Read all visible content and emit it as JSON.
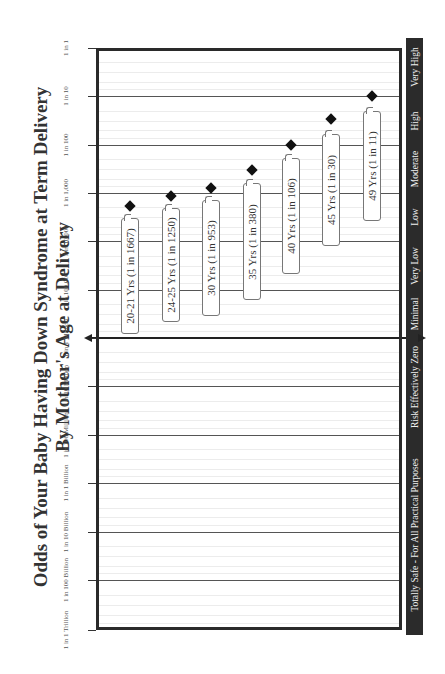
{
  "title": {
    "line1": "Odds of Your Baby Having Down Syndrome at Term Delivery",
    "line2": "By Mother's Age at Delivery"
  },
  "y_axis": {
    "ticks": [
      {
        "label": "1 in 1",
        "y": 48
      },
      {
        "label": "1 in 10",
        "y": 96
      },
      {
        "label": "1 in 100",
        "y": 145
      },
      {
        "label": "1 in 1,000",
        "y": 193
      },
      {
        "label": "1 in 10,000",
        "y": 241
      },
      {
        "label": "1 in 100,000",
        "y": 290
      },
      {
        "label": "1 in 1 Million",
        "y": 338
      },
      {
        "label": "1 in 10 Million",
        "y": 386
      },
      {
        "label": "1 in 100 Million",
        "y": 435
      },
      {
        "label": "1 in 1 Billion",
        "y": 483
      },
      {
        "label": "1 in 10 Billion",
        "y": 532
      },
      {
        "label": "1 in 100 Billion",
        "y": 580
      },
      {
        "label": "1 in 1 Trillion",
        "y": 630
      }
    ]
  },
  "risk_categories": [
    {
      "label": "Very High",
      "y0": 38,
      "y1": 96
    },
    {
      "label": "High",
      "y0": 96,
      "y1": 145
    },
    {
      "label": "Moderate",
      "y0": 145,
      "y1": 193
    },
    {
      "label": "Low",
      "y0": 193,
      "y1": 241
    },
    {
      "label": "Very Low",
      "y0": 241,
      "y1": 290
    },
    {
      "label": "Minimal",
      "y0": 290,
      "y1": 338
    },
    {
      "label": "Risk Effectively Zero",
      "y0": 338,
      "y1": 435
    },
    {
      "label": "Totally Safe - For All Practical Purposes",
      "y0": 435,
      "y1": 635
    }
  ],
  "chart_data": {
    "type": "scatter",
    "title": "Odds of Your Baby Having Down Syndrome at Term Delivery",
    "subtitle": "By Mother's Age at Delivery",
    "orientation": "rotated 90deg counter-clockwise",
    "xlabel": "Mother's Age at Delivery",
    "ylabel": "Odds (log scale)",
    "yscale": "log",
    "ylim": [
      "1 in 1 Trillion",
      "1 in 1"
    ],
    "grid": true,
    "categories": [
      "20-21 Yrs",
      "24-25 Yrs",
      "30 Yrs",
      "35 Yrs",
      "40 Yrs",
      "45 Yrs",
      "49 Yrs"
    ],
    "series": [
      {
        "name": "Odds (1 in N)",
        "values": [
          1667,
          1250,
          953,
          380,
          106,
          30,
          11
        ]
      }
    ],
    "labels": [
      "20-21 Yrs (1 in 1667)",
      "24-25 Yrs (1 in 1250)",
      "30 Yrs (1 in 953)",
      "35 Yrs (1 in 380)",
      "40 Yrs (1 in 106)",
      "45 Yrs (1 in 30)",
      "49 Yrs (1 in 11)"
    ],
    "tick_labels": [
      "1 in 1",
      "1 in 10",
      "1 in 100",
      "1 in 1,000",
      "1 in 10,000",
      "1 in 100,000",
      "1 in 1 Million",
      "1 in 10 Million",
      "1 in 100 Million",
      "1 in 1 Billion",
      "1 in 10 Billion",
      "1 in 100 Billion",
      "1 in 1 Trillion"
    ],
    "risk_bands": [
      "Very High",
      "High",
      "Moderate",
      "Low",
      "Very Low",
      "Minimal",
      "Risk Effectively Zero",
      "Totally Safe - For All Practical Purposes"
    ]
  },
  "points": [
    {
      "label": "20-21 Yrs (1 in 1667)",
      "x": 130,
      "y": 206,
      "box_top": 218,
      "box_bottom": 334
    },
    {
      "label": "24-25 Yrs (1 in 1250)",
      "x": 171,
      "y": 196,
      "box_top": 208,
      "box_bottom": 322
    },
    {
      "label": "30 Yrs (1 in 953)",
      "x": 211,
      "y": 188,
      "box_top": 200,
      "box_bottom": 316
    },
    {
      "label": "35 Yrs (1 in 380)",
      "x": 252,
      "y": 170,
      "box_top": 183,
      "box_bottom": 300
    },
    {
      "label": "40 Yrs (1 in 106)",
      "x": 291,
      "y": 145,
      "box_top": 158,
      "box_bottom": 274
    },
    {
      "label": "45 Yrs (1 in 30)",
      "x": 331,
      "y": 119,
      "box_top": 134,
      "box_bottom": 246
    },
    {
      "label": "49 Yrs (1 in 11)",
      "x": 372,
      "y": 96,
      "box_top": 111,
      "box_bottom": 221
    }
  ]
}
